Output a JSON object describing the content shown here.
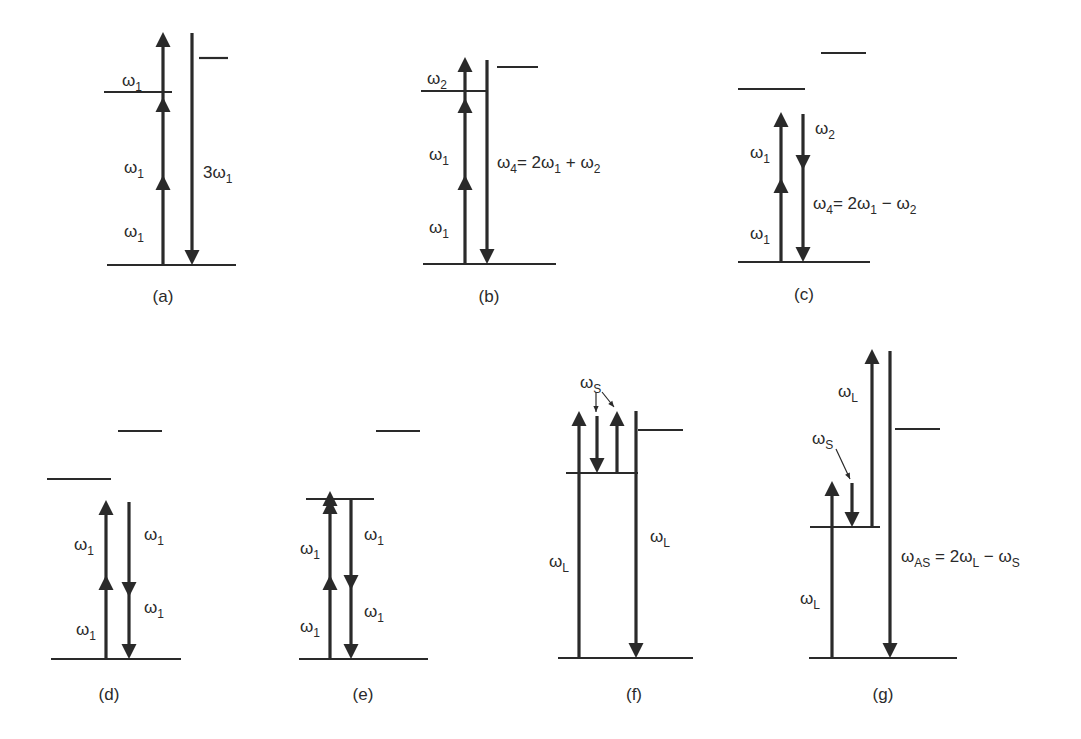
{
  "figure": {
    "colors": {
      "ink": "#2a2a2a",
      "background": "#ffffff"
    },
    "panels": [
      {
        "id": "a",
        "caption": "(a)",
        "caption_pos": [
          163,
          302
        ],
        "levels": [
          [
            107,
            265,
            236,
            265
          ],
          [
            104,
            92,
            172,
            92
          ],
          [
            199,
            58,
            228,
            58
          ]
        ],
        "arrows": [
          {
            "x": 163,
            "y1": 265,
            "y2": 32,
            "dir": "up",
            "mid_heads": [
              190,
              112
            ]
          },
          {
            "x": 192,
            "y1": 33,
            "y2": 265,
            "dir": "down",
            "mid_heads": []
          }
        ],
        "thin_arrows": [],
        "labels": [
          {
            "text": "ω",
            "sub": "1",
            "x": 122,
            "y": 86
          },
          {
            "text": "ω",
            "sub": "1",
            "x": 124,
            "y": 173
          },
          {
            "text": "ω",
            "sub": "1",
            "x": 124,
            "y": 237
          },
          {
            "text": "3ω",
            "sub": "1",
            "x": 203,
            "y": 178
          }
        ]
      },
      {
        "id": "b",
        "caption": "(b)",
        "caption_pos": [
          489,
          302
        ],
        "levels": [
          [
            423,
            264,
            556,
            264
          ],
          [
            421,
            91,
            487,
            91
          ],
          [
            497,
            67,
            538,
            67
          ]
        ],
        "arrows": [
          {
            "x": 465,
            "y1": 264,
            "y2": 57,
            "dir": "up",
            "mid_heads": [
              190,
              113
            ]
          },
          {
            "x": 487,
            "y1": 60,
            "y2": 264,
            "dir": "down",
            "mid_heads": []
          }
        ],
        "thin_arrows": [],
        "labels": [
          {
            "text": "ω",
            "sub": "2",
            "x": 427,
            "y": 84
          },
          {
            "text": "ω",
            "sub": "1",
            "x": 429,
            "y": 160
          },
          {
            "text": "ω",
            "sub": "1",
            "x": 429,
            "y": 233
          },
          {
            "text": "ω",
            "sub": "4",
            "x": 497,
            "y": 168,
            "tail": "= 2ω",
            "tail_sub": "1",
            "tail2": " + ω",
            "tail2_sub": "2"
          }
        ]
      },
      {
        "id": "c",
        "caption": "(c)",
        "caption_pos": [
          804,
          300
        ],
        "levels": [
          [
            738,
            262,
            870,
            262
          ],
          [
            738,
            89,
            805,
            89
          ],
          [
            821,
            53,
            866,
            53
          ]
        ],
        "arrows": [
          {
            "x": 781,
            "y1": 262,
            "y2": 112,
            "dir": "up",
            "mid_heads": [
              193
            ]
          },
          {
            "x": 803,
            "y1": 114,
            "y2": 262,
            "dir": "down",
            "mid_heads": [
              155
            ]
          }
        ],
        "thin_arrows": [],
        "labels": [
          {
            "text": "ω",
            "sub": "1",
            "x": 750,
            "y": 158
          },
          {
            "text": "ω",
            "sub": "2",
            "x": 815,
            "y": 134
          },
          {
            "text": "ω",
            "sub": "1",
            "x": 750,
            "y": 239
          },
          {
            "text": "ω",
            "sub": "4",
            "x": 813,
            "y": 209,
            "tail": "= 2ω",
            "tail_sub": "1",
            "tail2": " − ω",
            "tail2_sub": "2"
          }
        ]
      },
      {
        "id": "d",
        "caption": "(d)",
        "caption_pos": [
          109,
          700
        ],
        "levels": [
          [
            51,
            659,
            181,
            659
          ],
          [
            47,
            479,
            111,
            479
          ],
          [
            118,
            431,
            162,
            431
          ]
        ],
        "arrows": [
          {
            "x": 106,
            "y1": 659,
            "y2": 500,
            "dir": "up",
            "mid_heads": [
              590
            ]
          },
          {
            "x": 129,
            "y1": 502,
            "y2": 659,
            "dir": "down",
            "mid_heads": [
              582
            ]
          }
        ],
        "thin_arrows": [],
        "labels": [
          {
            "text": "ω",
            "sub": "1",
            "x": 74,
            "y": 550
          },
          {
            "text": "ω",
            "sub": "1",
            "x": 144,
            "y": 540
          },
          {
            "text": "ω",
            "sub": "1",
            "x": 144,
            "y": 613
          },
          {
            "text": "ω",
            "sub": "1",
            "x": 76,
            "y": 635
          }
        ]
      },
      {
        "id": "e",
        "caption": "(e)",
        "caption_pos": [
          363,
          700
        ],
        "levels": [
          [
            299,
            659,
            428,
            659
          ],
          [
            306,
            499,
            374,
            499
          ],
          [
            376,
            431,
            420,
            431
          ]
        ],
        "arrows": [
          {
            "x": 330,
            "y1": 659,
            "y2": 499,
            "dir": "up",
            "mid_heads": [
              590,
              506
            ]
          },
          {
            "x": 351,
            "y1": 499,
            "y2": 659,
            "dir": "down",
            "mid_heads": [
              575
            ]
          }
        ],
        "thin_arrows": [],
        "labels": [
          {
            "text": "ω",
            "sub": "1",
            "x": 300,
            "y": 554
          },
          {
            "text": "ω",
            "sub": "1",
            "x": 364,
            "y": 540
          },
          {
            "text": "ω",
            "sub": "1",
            "x": 364,
            "y": 617
          },
          {
            "text": "ω",
            "sub": "1",
            "x": 300,
            "y": 632
          }
        ]
      },
      {
        "id": "f",
        "caption": "(f)",
        "caption_pos": [
          634,
          700
        ],
        "levels": [
          [
            558,
            658,
            693,
            658
          ],
          [
            566,
            473,
            638,
            473
          ],
          [
            638,
            430,
            683,
            430
          ]
        ],
        "arrows": [
          {
            "x": 579,
            "y1": 658,
            "y2": 411,
            "dir": "up",
            "mid_heads": []
          },
          {
            "x": 597,
            "y1": 416,
            "y2": 473,
            "dir": "down",
            "mid_heads": []
          },
          {
            "x": 617,
            "y1": 473,
            "y2": 411,
            "dir": "up",
            "mid_heads": []
          },
          {
            "x": 636,
            "y1": 411,
            "y2": 658,
            "dir": "down",
            "mid_heads": []
          }
        ],
        "thin_arrows": [
          {
            "x1": 596,
            "y1": 392,
            "x2": 596,
            "y2": 412
          },
          {
            "x1": 602,
            "y1": 392,
            "x2": 614,
            "y2": 407
          }
        ],
        "labels": [
          {
            "text": "ω",
            "sub": "S",
            "x": 580,
            "y": 388
          },
          {
            "text": "ω",
            "sub": "L",
            "x": 549,
            "y": 567
          },
          {
            "text": "ω",
            "sub": "L",
            "x": 650,
            "y": 542
          }
        ]
      },
      {
        "id": "g",
        "caption": "(g)",
        "caption_pos": [
          883,
          700
        ],
        "levels": [
          [
            809,
            658,
            957,
            658
          ],
          [
            810,
            527,
            880,
            527
          ],
          [
            895,
            429,
            940,
            429
          ]
        ],
        "arrows": [
          {
            "x": 832,
            "y1": 658,
            "y2": 481,
            "dir": "up",
            "mid_heads": []
          },
          {
            "x": 852,
            "y1": 483,
            "y2": 527,
            "dir": "down",
            "mid_heads": []
          },
          {
            "x": 872,
            "y1": 527,
            "y2": 349,
            "dir": "up",
            "mid_heads": []
          },
          {
            "x": 890,
            "y1": 351,
            "y2": 658,
            "dir": "down",
            "mid_heads": []
          }
        ],
        "thin_arrows": [
          {
            "x1": 836,
            "y1": 449,
            "x2": 850,
            "y2": 479
          }
        ],
        "labels": [
          {
            "text": "ω",
            "sub": "L",
            "x": 838,
            "y": 397
          },
          {
            "text": "ω",
            "sub": "S",
            "x": 812,
            "y": 444
          },
          {
            "text": "ω",
            "sub": "L",
            "x": 800,
            "y": 604
          },
          {
            "text": "ω",
            "sub": "AS",
            "x": 901,
            "y": 562,
            "tail": " = 2ω",
            "tail_sub": "L",
            "tail2": " − ω",
            "tail2_sub": "S"
          }
        ]
      }
    ]
  }
}
